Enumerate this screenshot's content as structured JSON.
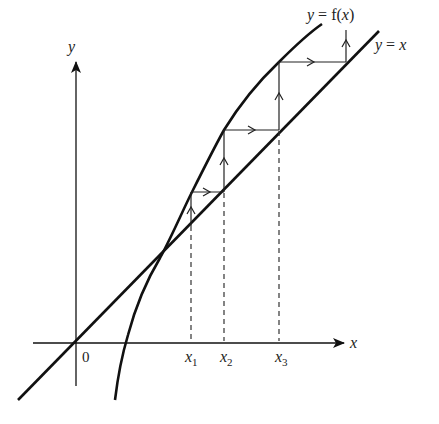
{
  "diagram": {
    "type": "cobweb-iteration",
    "labels": {
      "curve": "y = f(x)",
      "line": "y = x",
      "y_axis": "y",
      "x_axis": "x",
      "origin": "0",
      "x1": "x",
      "x1_sub": "1",
      "x2": "x",
      "x2_sub": "2",
      "x3": "x",
      "x3_sub": "3"
    },
    "colors": {
      "ink": "#111111",
      "label": "#222222",
      "background": "#ffffff"
    }
  }
}
